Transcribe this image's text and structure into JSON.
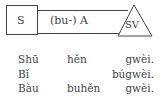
{
  "diagram": {
    "subject_box": "S",
    "middle_box": "(bu-) A",
    "triangle": "SV"
  },
  "examples": [
    {
      "c1": "Shū",
      "c2": "hěn",
      "c3": "gwèi."
    },
    {
      "c1": "Bǐ",
      "c2": "",
      "c3": "búgwèi."
    },
    {
      "c1": "Bàu",
      "c2": "buhěn",
      "c3": "gwèi."
    }
  ]
}
